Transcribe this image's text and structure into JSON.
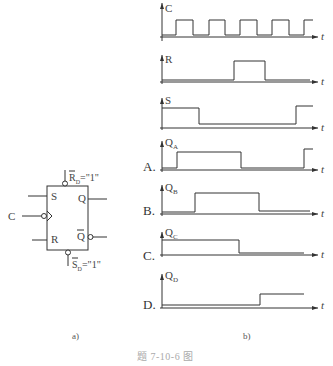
{
  "figure_caption": "题 7-10-6 图",
  "subfig_a_label": "a)",
  "subfig_b_label": "b)",
  "flipflop": {
    "pins": {
      "S": "S",
      "R": "R",
      "C": "C",
      "Q": "Q",
      "Qbar": "Q"
    },
    "rd_label": "R",
    "rd_sub": "D",
    "rd_value": "=\"1\"",
    "sd_label": "S",
    "sd_sub": "D",
    "sd_value": "=\"1\""
  },
  "waveforms": {
    "time_label": "t",
    "signals": [
      {
        "name": "C",
        "sub": ""
      },
      {
        "name": "R",
        "sub": ""
      },
      {
        "name": "S",
        "sub": ""
      },
      {
        "name": "Q",
        "sub": "A",
        "option": "A."
      },
      {
        "name": "Q",
        "sub": "B",
        "option": "B."
      },
      {
        "name": "Q",
        "sub": "C",
        "option": "C."
      },
      {
        "name": "Q",
        "sub": "D",
        "option": "D."
      }
    ]
  }
}
